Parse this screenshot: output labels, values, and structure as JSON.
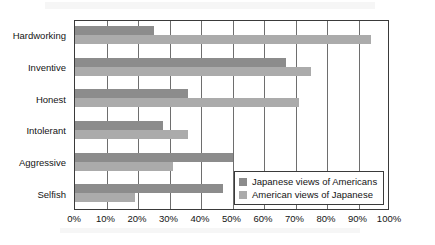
{
  "chart_data": {
    "type": "bar",
    "orientation": "horizontal",
    "title": "",
    "subtitle": "",
    "xlabel": "",
    "ylabel": "",
    "xlim": [
      0,
      100
    ],
    "grid": true,
    "legend_position": "inside-bottom-right",
    "categories": [
      "Hardworking",
      "Inventive",
      "Honest",
      "Intolerant",
      "Aggressive",
      "Selfish"
    ],
    "xticks": [
      0,
      10,
      20,
      30,
      40,
      50,
      60,
      70,
      80,
      90,
      100
    ],
    "xtick_labels": [
      "0%",
      "10%",
      "20%",
      "30%",
      "40%",
      "50%",
      "60%",
      "70%",
      "80%",
      "90%",
      "100%"
    ],
    "series": [
      {
        "name": "Japanese views of Americans",
        "color": "#8c8c8c",
        "values": [
          25,
          67,
          36,
          28,
          50,
          47
        ]
      },
      {
        "name": "American views of Japanese",
        "color": "#ababab",
        "values": [
          94,
          75,
          71,
          36,
          31,
          19
        ]
      }
    ]
  },
  "legend": {
    "items": [
      {
        "label": "Japanese views of Americans",
        "color": "#8c8c8c"
      },
      {
        "label": "American views of Japanese",
        "color": "#ababab"
      }
    ]
  },
  "colors": {
    "series_dark": "#8c8c8c",
    "series_light": "#ababab",
    "axis": "#3a3a3a",
    "gridline": "#6e6e6e",
    "text": "#141414",
    "background": "#ffffff"
  }
}
